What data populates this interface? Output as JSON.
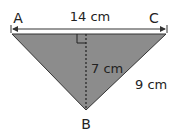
{
  "diagram": {
    "vertices": {
      "A": {
        "label": "A"
      },
      "B": {
        "label": "B"
      },
      "C": {
        "label": "C"
      }
    },
    "measurements": {
      "base": "14 cm",
      "height": "7 cm",
      "side_bc": "9 cm"
    },
    "colors": {
      "fill": "#8c8c8c",
      "stroke": "#333333",
      "text": "#222222"
    }
  }
}
